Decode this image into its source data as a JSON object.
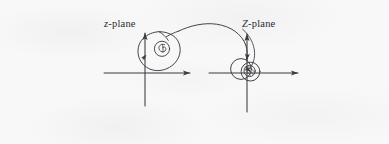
{
  "figure": {
    "caption_text": "",
    "background_color": "#f8f8f9",
    "ink_color": "#3a3a40",
    "left_plane": {
      "label_italic_symbol": "z",
      "label_suffix": "-plane",
      "label_full": "z-plane",
      "origin": {
        "x": 145,
        "y": 73
      },
      "x_axis": {
        "from_x": 104,
        "to_x": 197,
        "y": 73,
        "arrow": "right"
      },
      "y_axis": {
        "x": 145,
        "from_y": 105,
        "to_y": 27,
        "arrow": "up"
      },
      "contour_name": "closed-contour-pear-shape",
      "contour_direction_marker": "arrowhead-left-side",
      "inner_feature": "small-circle-with-spiral"
    },
    "right_plane": {
      "label_italic_symbol": "Z",
      "label_suffix": "-plane",
      "label_full": "Z-plane",
      "origin": {
        "x": 247,
        "y": 73
      },
      "x_axis": {
        "from_x": 209,
        "to_x": 305,
        "y": 73,
        "arrow": "right"
      },
      "y_axis": {
        "x": 247,
        "from_y": 112,
        "to_y": 28,
        "arrow": "up"
      },
      "contour_name": "two-overlapping-circles",
      "inner_feature": "small-circle-with-arrow-hatch"
    },
    "mapping_arc": {
      "name": "mapping-arc",
      "from": "left-plane-contour",
      "to": "right-plane-contour",
      "arrow": "downward-at-right-end"
    }
  }
}
